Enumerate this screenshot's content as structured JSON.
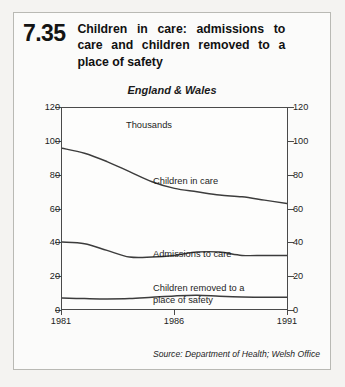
{
  "figure": {
    "number": "7.35",
    "title": "Children in care: admissions to care and children removed to a place of safety",
    "subtitle": "England & Wales",
    "source": "Source: Department of Health; Welsh Office"
  },
  "chart_data": {
    "type": "line",
    "title": "Children in care: admissions to care and children removed to a place of safety",
    "subtitle": "England & Wales",
    "unit_label": "Thousands",
    "xlabel": "",
    "ylabel": "Thousands",
    "xlim": [
      1981,
      1991
    ],
    "ylim": [
      0,
      120
    ],
    "ytick_labels": [
      "0",
      "20",
      "40",
      "60",
      "80",
      "100",
      "120"
    ],
    "ytick_values": [
      0,
      20,
      40,
      60,
      80,
      100,
      120
    ],
    "xtick_labels": [
      "1981",
      "1986",
      "1991"
    ],
    "xtick_values": [
      1981,
      1986,
      1991
    ],
    "grid": false,
    "legend": "inline-annotations",
    "dual_y_axis": true,
    "x": [
      1981,
      1982,
      1983,
      1984,
      1985,
      1986,
      1987,
      1988,
      1989,
      1990,
      1991
    ],
    "series": [
      {
        "name": "Children in care",
        "values": [
          96,
          93,
          88,
          82,
          76,
          72,
          70,
          68,
          67,
          65,
          63
        ]
      },
      {
        "name": "Admissions to care",
        "values": [
          40,
          39,
          35,
          31,
          31,
          32,
          34,
          34,
          32,
          32,
          32
        ]
      },
      {
        "name": "Children removed to a place of safety",
        "values": [
          6.5,
          6.2,
          6.0,
          6.2,
          7.0,
          7.8,
          8.2,
          7.6,
          7.2,
          7.0,
          7.0
        ]
      }
    ]
  },
  "axis": {
    "left_ticks": [
      "120",
      "100",
      "80",
      "60",
      "40",
      "20",
      "0"
    ],
    "right_ticks": [
      "120",
      "100",
      "80",
      "60",
      "40",
      "20",
      "0"
    ],
    "x_ticks": [
      "1981",
      "1986",
      "1991"
    ]
  },
  "annotations": {
    "thousands": "Thousands",
    "children_in_care": "Children in care",
    "admissions_to_care": "Admissions to care",
    "removed_to_safety": "Children removed to a\nplace of safety"
  }
}
